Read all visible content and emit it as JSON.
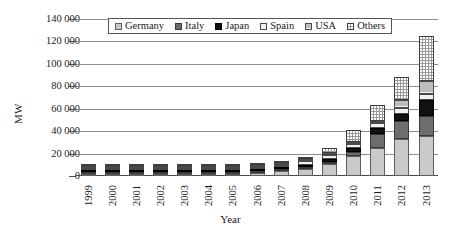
{
  "chart_data": {
    "type": "bar",
    "subtype": "stacked-column",
    "title": "",
    "xlabel": "Year",
    "ylabel": "MW",
    "ylim": [
      0,
      140000
    ],
    "ytick_labels": [
      "140 000",
      "120 000",
      "100 000",
      "80 000",
      "60 000",
      "40 000",
      "20 000",
      "0"
    ],
    "ytick_values": [
      140000,
      120000,
      100000,
      80000,
      60000,
      40000,
      20000,
      0
    ],
    "grid": true,
    "legend_position": "top-center-inside",
    "categories": [
      "1999",
      "2000",
      "2001",
      "2002",
      "2003",
      "2004",
      "2005",
      "2006",
      "2007",
      "2008",
      "2009",
      "2010",
      "2011",
      "2012",
      "2013"
    ],
    "series": [
      {
        "name": "Germany",
        "pattern": "light-gray-dotted",
        "color": "#c9c9c9",
        "values": [
          70,
          114,
          195,
          296,
          435,
          1105,
          2056,
          2899,
          4170,
          6120,
          10566,
          17554,
          25039,
          32643,
          35948
        ]
      },
      {
        "name": "Italy",
        "pattern": "dark-gray-solid",
        "color": "#6d6d6d",
        "values": [
          1,
          1,
          1,
          1,
          1,
          1,
          2,
          2,
          4,
          25,
          521,
          3502,
          12803,
          16365,
          17928
        ]
      },
      {
        "name": "Japan",
        "pattern": "black-solid",
        "color": "#111111",
        "values": [
          209,
          318,
          453,
          637,
          860,
          1132,
          1422,
          1709,
          1919,
          2144,
          2627,
          3618,
          4914,
          6632,
          13599
        ]
      },
      {
        "name": "Spain",
        "pattern": "white-outline",
        "color": "#f2f2f2",
        "values": [
          9,
          12,
          16,
          21,
          30,
          37,
          58,
          148,
          693,
          3355,
          3438,
          3892,
          4283,
          4646,
          5340
        ]
      },
      {
        "name": "USA",
        "pattern": "light-gray-hatched",
        "color": "#bdbdbd",
        "values": [
          21,
          22,
          24,
          45,
          62,
          76,
          79,
          145,
          212,
          347,
          640,
          1256,
          2149,
          7332,
          12079
        ]
      },
      {
        "name": "Others",
        "pattern": "gray-speckled",
        "color": "#9a9a9a",
        "values": [
          41,
          57,
          79,
          114,
          150,
          245,
          378,
          525,
          915,
          1760,
          5060,
          10860,
          13840,
          20850,
          40270
        ]
      }
    ],
    "totals": [
      351,
      524,
      768,
      1114,
      1538,
      2596,
      3995,
      5428,
      7913,
      13751,
      22852,
      40682,
      63028,
      88468,
      125164
    ],
    "units": "MW"
  },
  "legend": {
    "items": [
      {
        "label": "Germany",
        "swatch": "germany-swatch"
      },
      {
        "label": "Italy",
        "swatch": "italy-swatch"
      },
      {
        "label": "Japan",
        "swatch": "japan-swatch"
      },
      {
        "label": "Spain",
        "swatch": "spain-swatch"
      },
      {
        "label": "USA",
        "swatch": "usa-swatch"
      },
      {
        "label": "Others",
        "swatch": "others-swatch"
      }
    ]
  }
}
